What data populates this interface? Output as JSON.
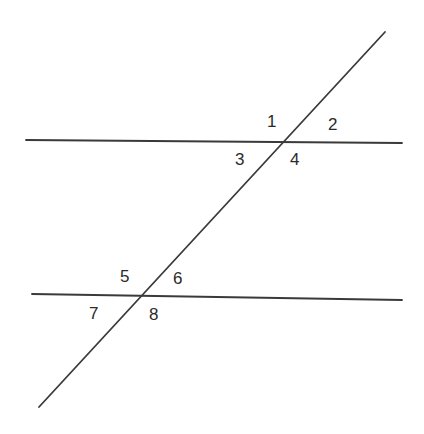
{
  "diagram": {
    "type": "parallel-lines-transversal",
    "background": "#ffffff",
    "line_color": "#3a3a3a",
    "lines": [
      {
        "name": "upper-parallel-line",
        "x1": 26,
        "y1": 140,
        "x2": 402,
        "y2": 143
      },
      {
        "name": "lower-parallel-line",
        "x1": 32,
        "y1": 294,
        "x2": 402,
        "y2": 300
      },
      {
        "name": "transversal-line",
        "x1": 385,
        "y1": 32,
        "x2": 39,
        "y2": 407
      }
    ],
    "intersections": [
      {
        "name": "upper-intersection",
        "x": 284,
        "y": 142
      },
      {
        "name": "lower-intersection",
        "x": 141,
        "y": 296
      }
    ],
    "angle_labels": [
      {
        "id": "1",
        "text": "1",
        "x": 267,
        "y": 127
      },
      {
        "id": "2",
        "text": "2",
        "x": 328,
        "y": 130
      },
      {
        "id": "3",
        "text": "3",
        "x": 235,
        "y": 165
      },
      {
        "id": "4",
        "text": "4",
        "x": 290,
        "y": 165
      },
      {
        "id": "5",
        "text": "5",
        "x": 120,
        "y": 282
      },
      {
        "id": "6",
        "text": "6",
        "x": 173,
        "y": 284
      },
      {
        "id": "7",
        "text": "7",
        "x": 89,
        "y": 319
      },
      {
        "id": "8",
        "text": "8",
        "x": 149,
        "y": 320
      }
    ]
  }
}
